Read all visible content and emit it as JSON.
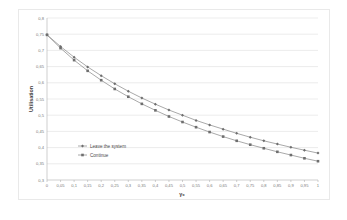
{
  "chart_data": {
    "type": "line",
    "title": "",
    "xlabel": "γ₀",
    "ylabel": "Utilisation",
    "xlim": [
      0,
      1
    ],
    "ylim": [
      0.3,
      0.8
    ],
    "grid": true,
    "legend_position": "inside-center-left",
    "decimal_separator": ",",
    "x": [
      0,
      0.05,
      0.1,
      0.15,
      0.2,
      0.25,
      0.3,
      0.35,
      0.4,
      0.45,
      0.5,
      0.55,
      0.6,
      0.65,
      0.7,
      0.75,
      0.8,
      0.85,
      0.9,
      0.95,
      1
    ],
    "xticklabels": [
      "0",
      "0,05",
      "0,1",
      "0,15",
      "0,2",
      "0,25",
      "0,3",
      "0,35",
      "0,4",
      "0,45",
      "0,5",
      "0,55",
      "0,6",
      "0,65",
      "0,7",
      "0,75",
      "0,8",
      "0,85",
      "0,9",
      "0,95",
      "1"
    ],
    "yticks": [
      0.3,
      0.35,
      0.4,
      0.45,
      0.5,
      0.55,
      0.6,
      0.65,
      0.7,
      0.75,
      0.8
    ],
    "yticklabels": [
      "0,3",
      "0,35",
      "0,4",
      "0,45",
      "0,5",
      "0,55",
      "0,6",
      "0,65",
      "0,7",
      "0,75",
      "0,8"
    ],
    "series": [
      {
        "name": "Leave the system",
        "marker": "diamond",
        "color": "#8c8c8c",
        "values": [
          0.748,
          0.712,
          0.679,
          0.649,
          0.622,
          0.597,
          0.574,
          0.553,
          0.534,
          0.516,
          0.5,
          0.484,
          0.47,
          0.457,
          0.444,
          0.432,
          0.421,
          0.411,
          0.401,
          0.392,
          0.383
        ]
      },
      {
        "name": "Continue",
        "marker": "square",
        "color": "#8c8c8c",
        "values": [
          0.748,
          0.707,
          0.67,
          0.637,
          0.608,
          0.581,
          0.557,
          0.535,
          0.515,
          0.496,
          0.479,
          0.463,
          0.448,
          0.434,
          0.421,
          0.409,
          0.398,
          0.387,
          0.377,
          0.367,
          0.358
        ]
      }
    ]
  },
  "legend": {
    "items": [
      {
        "label": "Leave the system"
      },
      {
        "label": "Continue"
      }
    ]
  }
}
